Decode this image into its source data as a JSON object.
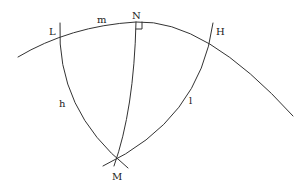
{
  "diagram": {
    "type": "spherical-triangle",
    "stroke_color": "#333333",
    "labels": {
      "L": "L",
      "m": "m",
      "N": "N",
      "H": "H",
      "h": "h",
      "l": "l",
      "M": "M"
    },
    "points": {
      "L": [
        60,
        38
      ],
      "N": [
        136,
        22
      ],
      "H": [
        211,
        32
      ],
      "M": [
        117,
        160
      ]
    },
    "right_angle_at": "N"
  }
}
